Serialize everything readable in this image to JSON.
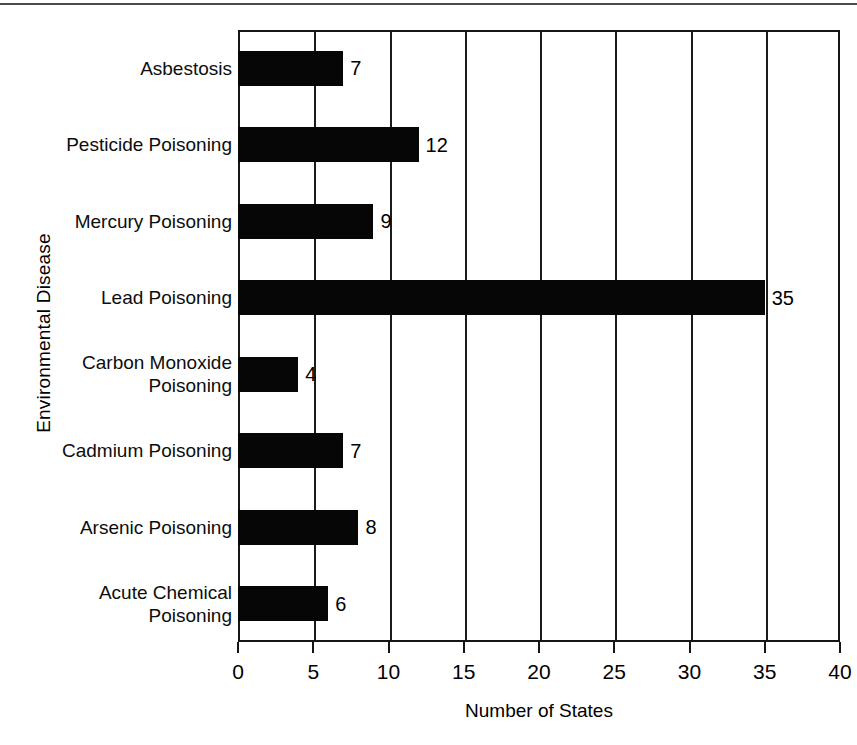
{
  "chart_data": {
    "type": "bar",
    "orientation": "horizontal",
    "title": "",
    "xlabel": "Number of States",
    "ylabel": "Environmental Disease",
    "xlim": [
      0,
      40
    ],
    "xticks": [
      0,
      5,
      10,
      15,
      20,
      25,
      30,
      35,
      40
    ],
    "xtick_labels": [
      "0",
      "5",
      "10",
      "15",
      "20",
      "25",
      "30",
      "35",
      "40"
    ],
    "grid": true,
    "grid_axis": "x",
    "legend": "none",
    "bar_color": "#060606",
    "categories": [
      "Asbestosis",
      "Pesticide Poisoning",
      "Mercury Poisoning",
      "Lead Poisoning",
      "Carbon Monoxide\nPoisoning",
      "Cadmium Poisoning",
      "Arsenic Poisoning",
      "Acute Chemical\nPoisoning"
    ],
    "values": [
      7,
      12,
      9,
      35,
      4,
      7,
      8,
      6
    ],
    "value_labels": [
      "7",
      "12",
      "9",
      "35",
      "4",
      "7",
      "8",
      "6"
    ]
  }
}
